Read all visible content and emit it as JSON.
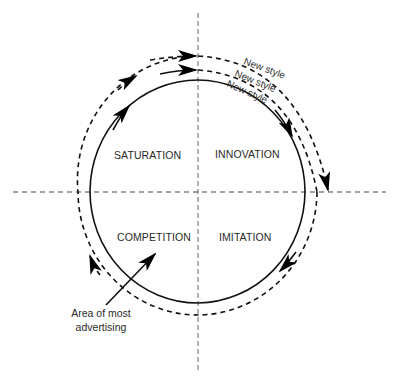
{
  "diagram": {
    "quadrants": {
      "top_left": "SATURATION",
      "top_right": "INNOVATION",
      "bottom_left": "COMPETITION",
      "bottom_right": "IMITATION"
    },
    "new_style_labels": [
      "New style",
      "New style",
      "New style"
    ],
    "annotation": {
      "line1": "Area of most",
      "line2": "advertising"
    }
  }
}
